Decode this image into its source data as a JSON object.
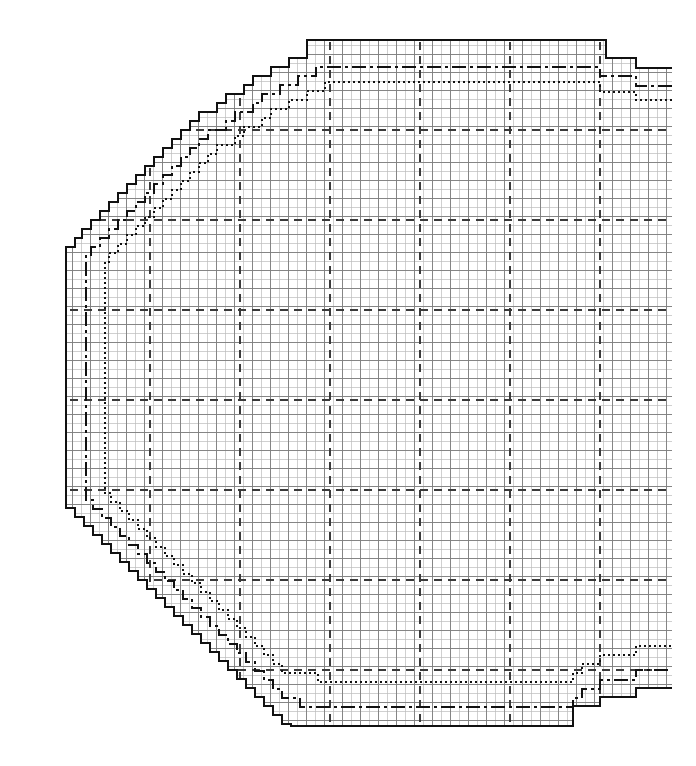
{
  "document": {
    "title": "Upper Sleeve Chart",
    "kind": "sewing-pattern-draft",
    "background": "#ffffff",
    "ink": "#111111"
  },
  "labels": {
    "chart_title": "Upper Sleeve Chart"
  },
  "chart_data": {
    "type": "line",
    "title": "Upper Sleeve Chart",
    "subtitle": "",
    "xlabel": "",
    "ylabel": "",
    "xlim": [
      0,
      696
    ],
    "ylim": [
      0,
      766
    ],
    "grid": true,
    "legend_position": "none",
    "grid_spec": {
      "fine_cell_px": 9,
      "fine_color": "#b9b9b9",
      "medium_every_cells": 2,
      "medium_color": "#8a8a8a",
      "major_dashed_color": "#3a3a3a",
      "major_dash_pattern": "8,6",
      "plot_area": {
        "x0": 66,
        "y0": 40,
        "x1": 672,
        "y1": 726
      },
      "major_vertical_x": [
        150,
        240,
        330,
        420,
        510,
        600
      ],
      "major_horizontal_y": [
        130,
        220,
        310,
        400,
        490,
        580,
        670
      ]
    },
    "series": [
      {
        "name": "Size outline A (largest)",
        "style": "solid",
        "stroke_width": 2.6,
        "color": "#111111",
        "points": [
          [
            672,
            68
          ],
          [
            636,
            68
          ],
          [
            636,
            58
          ],
          [
            606,
            58
          ],
          [
            606,
            40
          ],
          [
            307,
            40
          ],
          [
            307,
            58
          ],
          [
            289,
            58
          ],
          [
            289,
            67
          ],
          [
            271,
            67
          ],
          [
            271,
            76
          ],
          [
            253,
            76
          ],
          [
            253,
            85
          ],
          [
            244,
            85
          ],
          [
            244,
            94
          ],
          [
            226,
            94
          ],
          [
            226,
            103
          ],
          [
            217,
            103
          ],
          [
            217,
            112
          ],
          [
            199,
            112
          ],
          [
            199,
            121
          ],
          [
            190,
            121
          ],
          [
            190,
            130
          ],
          [
            181,
            130
          ],
          [
            181,
            139
          ],
          [
            172,
            139
          ],
          [
            172,
            148
          ],
          [
            163,
            148
          ],
          [
            163,
            157
          ],
          [
            154,
            157
          ],
          [
            154,
            166
          ],
          [
            145,
            166
          ],
          [
            145,
            175
          ],
          [
            136,
            175
          ],
          [
            136,
            184
          ],
          [
            127,
            184
          ],
          [
            127,
            193
          ],
          [
            118,
            193
          ],
          [
            118,
            202
          ],
          [
            109,
            202
          ],
          [
            109,
            211
          ],
          [
            100,
            211
          ],
          [
            100,
            220
          ],
          [
            91,
            220
          ],
          [
            91,
            229
          ],
          [
            82,
            229
          ],
          [
            82,
            238
          ],
          [
            75,
            238
          ],
          [
            75,
            247
          ],
          [
            66,
            247
          ],
          [
            66,
            508
          ],
          [
            75,
            508
          ],
          [
            75,
            517
          ],
          [
            84,
            517
          ],
          [
            84,
            526
          ],
          [
            93,
            526
          ],
          [
            93,
            535
          ],
          [
            102,
            535
          ],
          [
            102,
            544
          ],
          [
            111,
            544
          ],
          [
            111,
            553
          ],
          [
            120,
            553
          ],
          [
            120,
            562
          ],
          [
            129,
            562
          ],
          [
            129,
            571
          ],
          [
            138,
            571
          ],
          [
            138,
            580
          ],
          [
            147,
            580
          ],
          [
            147,
            589
          ],
          [
            156,
            589
          ],
          [
            156,
            598
          ],
          [
            165,
            598
          ],
          [
            165,
            607
          ],
          [
            174,
            607
          ],
          [
            174,
            616
          ],
          [
            183,
            616
          ],
          [
            183,
            625
          ],
          [
            192,
            625
          ],
          [
            192,
            634
          ],
          [
            201,
            634
          ],
          [
            201,
            643
          ],
          [
            210,
            643
          ],
          [
            210,
            652
          ],
          [
            219,
            652
          ],
          [
            219,
            661
          ],
          [
            228,
            661
          ],
          [
            228,
            670
          ],
          [
            237,
            670
          ],
          [
            237,
            679
          ],
          [
            246,
            679
          ],
          [
            246,
            688
          ],
          [
            255,
            688
          ],
          [
            255,
            697
          ],
          [
            264,
            697
          ],
          [
            264,
            706
          ],
          [
            273,
            706
          ],
          [
            273,
            715
          ],
          [
            282,
            715
          ],
          [
            282,
            724
          ],
          [
            291,
            724
          ],
          [
            291,
            726
          ],
          [
            573,
            726
          ],
          [
            573,
            706
          ],
          [
            600,
            706
          ],
          [
            600,
            697
          ],
          [
            636,
            697
          ],
          [
            636,
            688
          ],
          [
            672,
            688
          ]
        ]
      },
      {
        "name": "Size outline B (middle)",
        "style": "dash-dot",
        "stroke_width": 2.0,
        "color": "#111111",
        "dash_pattern": "14,4,3,4",
        "points": [
          [
            672,
            86
          ],
          [
            636,
            86
          ],
          [
            636,
            76
          ],
          [
            600,
            76
          ],
          [
            600,
            67
          ],
          [
            316,
            67
          ],
          [
            316,
            76
          ],
          [
            298,
            76
          ],
          [
            298,
            85
          ],
          [
            280,
            85
          ],
          [
            280,
            94
          ],
          [
            262,
            94
          ],
          [
            262,
            103
          ],
          [
            253,
            103
          ],
          [
            253,
            112
          ],
          [
            235,
            112
          ],
          [
            235,
            121
          ],
          [
            226,
            121
          ],
          [
            226,
            130
          ],
          [
            208,
            130
          ],
          [
            208,
            139
          ],
          [
            199,
            139
          ],
          [
            199,
            148
          ],
          [
            190,
            148
          ],
          [
            190,
            157
          ],
          [
            181,
            157
          ],
          [
            181,
            166
          ],
          [
            172,
            166
          ],
          [
            172,
            175
          ],
          [
            163,
            175
          ],
          [
            163,
            184
          ],
          [
            154,
            184
          ],
          [
            154,
            193
          ],
          [
            145,
            193
          ],
          [
            145,
            202
          ],
          [
            136,
            202
          ],
          [
            136,
            211
          ],
          [
            127,
            211
          ],
          [
            127,
            220
          ],
          [
            118,
            220
          ],
          [
            118,
            229
          ],
          [
            109,
            229
          ],
          [
            109,
            238
          ],
          [
            100,
            238
          ],
          [
            100,
            247
          ],
          [
            91,
            247
          ],
          [
            91,
            256
          ],
          [
            86,
            256
          ],
          [
            86,
            500
          ],
          [
            93,
            500
          ],
          [
            93,
            509
          ],
          [
            102,
            509
          ],
          [
            102,
            518
          ],
          [
            111,
            518
          ],
          [
            111,
            527
          ],
          [
            120,
            527
          ],
          [
            120,
            536
          ],
          [
            129,
            536
          ],
          [
            129,
            545
          ],
          [
            138,
            545
          ],
          [
            138,
            554
          ],
          [
            147,
            554
          ],
          [
            147,
            563
          ],
          [
            156,
            563
          ],
          [
            156,
            572
          ],
          [
            165,
            572
          ],
          [
            165,
            581
          ],
          [
            174,
            581
          ],
          [
            174,
            590
          ],
          [
            183,
            590
          ],
          [
            183,
            599
          ],
          [
            192,
            599
          ],
          [
            192,
            608
          ],
          [
            201,
            608
          ],
          [
            201,
            617
          ],
          [
            210,
            617
          ],
          [
            210,
            626
          ],
          [
            219,
            626
          ],
          [
            219,
            635
          ],
          [
            228,
            635
          ],
          [
            228,
            644
          ],
          [
            237,
            644
          ],
          [
            237,
            653
          ],
          [
            246,
            653
          ],
          [
            246,
            662
          ],
          [
            255,
            662
          ],
          [
            255,
            671
          ],
          [
            264,
            671
          ],
          [
            264,
            680
          ],
          [
            273,
            680
          ],
          [
            273,
            689
          ],
          [
            282,
            689
          ],
          [
            282,
            698
          ],
          [
            291,
            698
          ],
          [
            300,
            698
          ],
          [
            300,
            707
          ],
          [
            573,
            707
          ],
          [
            573,
            698
          ],
          [
            582,
            698
          ],
          [
            582,
            689
          ],
          [
            600,
            689
          ],
          [
            600,
            680
          ],
          [
            636,
            680
          ],
          [
            636,
            670
          ],
          [
            672,
            670
          ]
        ]
      },
      {
        "name": "Size outline C (smallest)",
        "style": "dotted",
        "stroke_width": 2.0,
        "color": "#111111",
        "dash_pattern": "2,3",
        "points": [
          [
            672,
            100
          ],
          [
            636,
            100
          ],
          [
            636,
            92
          ],
          [
            600,
            92
          ],
          [
            600,
            82
          ],
          [
            325,
            82
          ],
          [
            325,
            91
          ],
          [
            307,
            91
          ],
          [
            307,
            100
          ],
          [
            289,
            100
          ],
          [
            289,
            109
          ],
          [
            271,
            109
          ],
          [
            271,
            118
          ],
          [
            262,
            118
          ],
          [
            262,
            127
          ],
          [
            244,
            127
          ],
          [
            244,
            136
          ],
          [
            235,
            136
          ],
          [
            235,
            145
          ],
          [
            217,
            145
          ],
          [
            217,
            154
          ],
          [
            208,
            154
          ],
          [
            208,
            163
          ],
          [
            199,
            163
          ],
          [
            199,
            172
          ],
          [
            190,
            172
          ],
          [
            190,
            181
          ],
          [
            181,
            181
          ],
          [
            181,
            190
          ],
          [
            172,
            190
          ],
          [
            172,
            199
          ],
          [
            163,
            199
          ],
          [
            163,
            208
          ],
          [
            154,
            208
          ],
          [
            154,
            217
          ],
          [
            145,
            217
          ],
          [
            145,
            226
          ],
          [
            136,
            226
          ],
          [
            136,
            235
          ],
          [
            127,
            235
          ],
          [
            127,
            244
          ],
          [
            118,
            244
          ],
          [
            118,
            253
          ],
          [
            109,
            253
          ],
          [
            109,
            262
          ],
          [
            105,
            262
          ],
          [
            105,
            493
          ],
          [
            111,
            493
          ],
          [
            111,
            502
          ],
          [
            120,
            502
          ],
          [
            120,
            511
          ],
          [
            129,
            511
          ],
          [
            129,
            520
          ],
          [
            138,
            520
          ],
          [
            138,
            529
          ],
          [
            147,
            529
          ],
          [
            147,
            538
          ],
          [
            156,
            538
          ],
          [
            156,
            547
          ],
          [
            165,
            547
          ],
          [
            165,
            556
          ],
          [
            174,
            556
          ],
          [
            174,
            565
          ],
          [
            183,
            565
          ],
          [
            183,
            574
          ],
          [
            192,
            574
          ],
          [
            192,
            583
          ],
          [
            201,
            583
          ],
          [
            201,
            592
          ],
          [
            210,
            592
          ],
          [
            210,
            601
          ],
          [
            219,
            601
          ],
          [
            219,
            610
          ],
          [
            228,
            610
          ],
          [
            228,
            619
          ],
          [
            237,
            619
          ],
          [
            237,
            628
          ],
          [
            246,
            628
          ],
          [
            246,
            637
          ],
          [
            255,
            637
          ],
          [
            255,
            646
          ],
          [
            264,
            646
          ],
          [
            264,
            655
          ],
          [
            273,
            655
          ],
          [
            273,
            664
          ],
          [
            282,
            664
          ],
          [
            282,
            673
          ],
          [
            291,
            673
          ],
          [
            300,
            673
          ],
          [
            309,
            673
          ],
          [
            318,
            673
          ],
          [
            318,
            682
          ],
          [
            573,
            682
          ],
          [
            573,
            673
          ],
          [
            582,
            673
          ],
          [
            582,
            664
          ],
          [
            600,
            664
          ],
          [
            600,
            655
          ],
          [
            636,
            655
          ],
          [
            636,
            646
          ],
          [
            672,
            646
          ]
        ]
      }
    ]
  }
}
